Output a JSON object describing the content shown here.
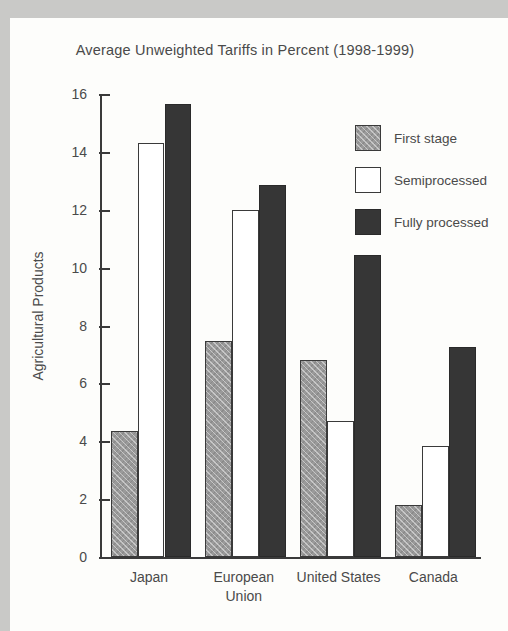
{
  "chart_data": {
    "type": "bar",
    "title": "Average Unweighted Tariffs in Percent (1998-1999)",
    "xlabel": "",
    "ylabel": "Agricultural Products",
    "ylim": [
      0,
      16
    ],
    "ytick_step": 2,
    "yticks": [
      "0",
      "2",
      "4",
      "6",
      "8",
      "10",
      "12",
      "14",
      "16"
    ],
    "grid": false,
    "legend_position": "top-right",
    "categories": [
      "Japan",
      "European Union",
      "United States",
      "Canada"
    ],
    "category_lines": [
      [
        "Japan"
      ],
      [
        "European",
        "Union"
      ],
      [
        "United States"
      ],
      [
        "Canada"
      ]
    ],
    "series": [
      {
        "name": "First stage",
        "color": "#9a9a9a",
        "values": [
          4.35,
          7.45,
          6.8,
          1.8
        ]
      },
      {
        "name": "Semiprocessed",
        "color": "#ffffff",
        "values": [
          14.3,
          12.0,
          4.7,
          3.85
        ]
      },
      {
        "name": "Fully processed",
        "color": "#363636",
        "values": [
          15.65,
          12.85,
          10.45,
          7.25
        ]
      }
    ]
  },
  "legend": {
    "items": [
      {
        "label": "First stage"
      },
      {
        "label": "Semiprocessed"
      },
      {
        "label": "Fully processed"
      }
    ]
  }
}
